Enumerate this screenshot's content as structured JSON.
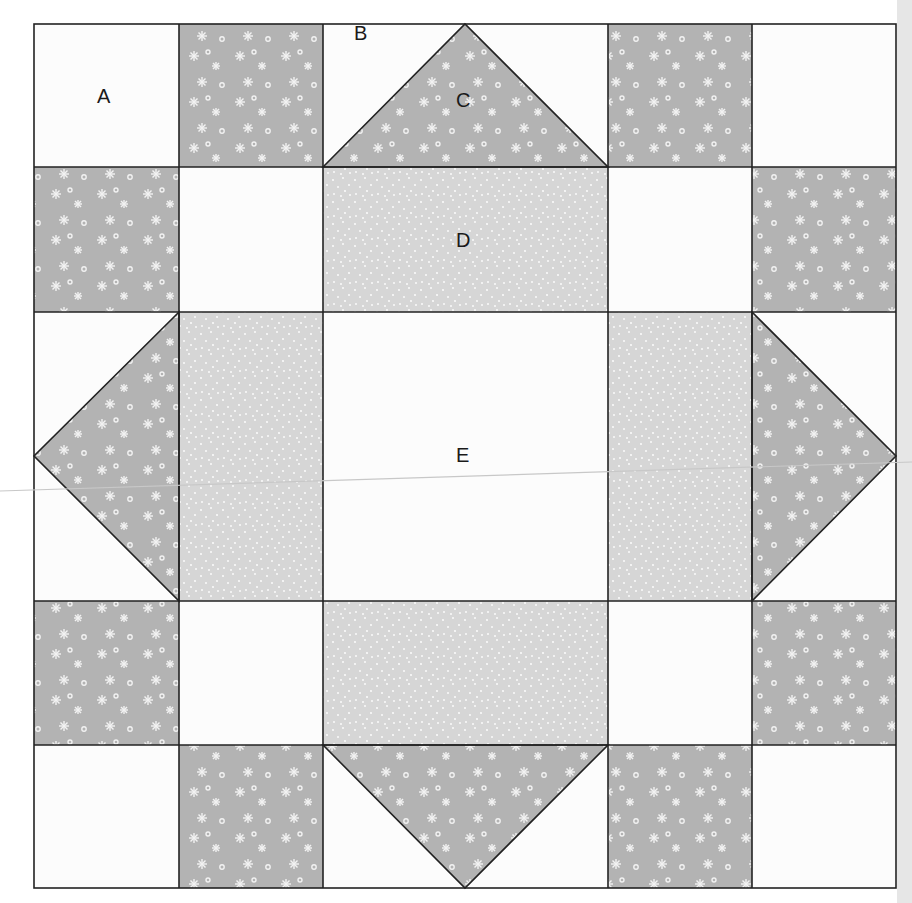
{
  "diagram": {
    "type": "quilt-block",
    "labels": {
      "A": "A",
      "B": "B",
      "C": "C",
      "D": "D",
      "E": "E"
    },
    "colors": {
      "background_fabric": "#fcfcfc",
      "floral_fabric": "#b3b3b3",
      "dotted_fabric": "#d6d6d6",
      "seam_lines": "#222222",
      "flower_motif": "#f2f2f2"
    },
    "grid": {
      "columns_px": [
        34,
        179,
        323,
        608,
        752,
        896
      ],
      "rows_px": [
        24,
        167,
        312,
        601,
        745,
        888
      ]
    },
    "pieces": [
      {
        "label": "A",
        "description": "corner background squares"
      },
      {
        "label": "B",
        "description": "background corners of flying-geese units"
      },
      {
        "label": "C",
        "description": "floral flying-geese triangles"
      },
      {
        "label": "D",
        "description": "dotted rectangles"
      },
      {
        "label": "E",
        "description": "center background square"
      }
    ]
  }
}
